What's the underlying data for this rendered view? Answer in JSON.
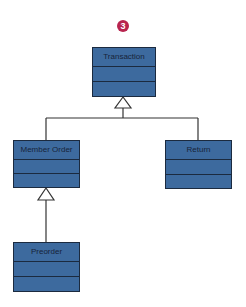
{
  "diagram": {
    "type": "uml-class-inheritance",
    "badge": {
      "label": "3",
      "color": "#b8244f"
    },
    "classes": [
      {
        "id": "transaction",
        "name": "Transaction"
      },
      {
        "id": "member-order",
        "name": "Member Order"
      },
      {
        "id": "return",
        "name": "Return"
      },
      {
        "id": "preorder",
        "name": "Preorder"
      }
    ],
    "relations": [
      {
        "type": "generalization",
        "from": "Member Order",
        "to": "Transaction"
      },
      {
        "type": "generalization",
        "from": "Return",
        "to": "Transaction"
      },
      {
        "type": "generalization",
        "from": "Preorder",
        "to": "Member Order"
      }
    ],
    "colors": {
      "box_fill": "#3d6a9e",
      "box_border": "#1b2a3f",
      "line": "#333333"
    }
  }
}
